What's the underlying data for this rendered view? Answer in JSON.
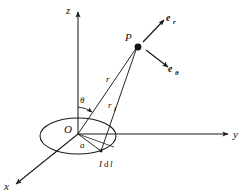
{
  "figure": {
    "background_color": "#ffffff",
    "line_color": "#1a1a1a",
    "text_color": "#111111"
  },
  "axes": [
    {
      "name": "z-axis",
      "label": "z",
      "direction": "up"
    },
    {
      "name": "y-axis",
      "label": "y",
      "direction": "right"
    },
    {
      "name": "x-axis",
      "label": "x",
      "direction": "lower-left"
    }
  ],
  "points": {
    "origin": {
      "label": "O"
    },
    "field_point": {
      "label": "P"
    }
  },
  "vectors": {
    "radial": {
      "base": "e",
      "sub": "r"
    },
    "polar": {
      "base": "e",
      "sub": "θ"
    }
  },
  "lengths": {
    "r_from_origin": {
      "base": "r",
      "sub": ""
    },
    "r_from_element": {
      "base": "r",
      "sub": "1"
    },
    "loop_radius": {
      "label": "a"
    }
  },
  "angles": {
    "polar_angle": {
      "label": "θ"
    }
  },
  "current_element": {
    "label_current": "I",
    "label_differential": "d",
    "label_length": "l",
    "full_label": "I dl"
  }
}
